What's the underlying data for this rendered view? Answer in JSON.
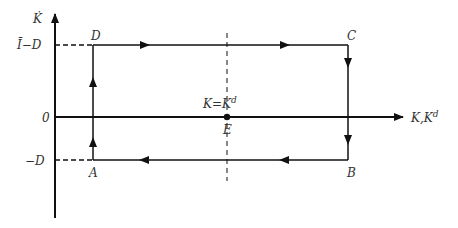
{
  "diagram": {
    "type": "phase-diagram",
    "y_axis": {
      "label": "K̇"
    },
    "x_axis": {
      "label": "K,K",
      "label_superscript": "d"
    },
    "y_ticks": {
      "top": "Ī−D",
      "zero": "0",
      "bottom": "−D"
    },
    "points": {
      "A": "A",
      "B": "B",
      "C": "C",
      "D": "D",
      "E": "E"
    },
    "equilibrium_label": {
      "main": "K=K",
      "superscript": "d"
    },
    "cycle_direction": [
      "A→D",
      "D→C",
      "C→B",
      "B→A"
    ],
    "colors": {
      "line": "#111111",
      "text": "#333333"
    }
  }
}
